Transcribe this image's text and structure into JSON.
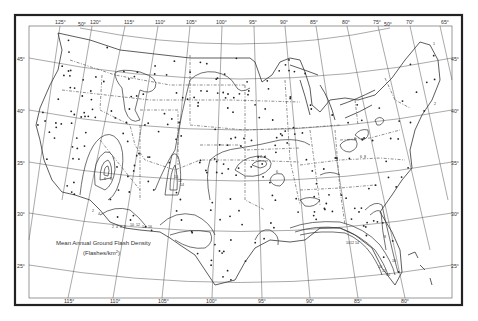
{
  "map": {
    "title_line1": "Mean Annual Ground Flash Density",
    "title_line2": "(Flashes/km",
    "title_units_sup": "2",
    "title_line2_end": ")",
    "top_longitude_labels": [
      "125°",
      "120°",
      "115°",
      "110°",
      "105°",
      "100°",
      "95°",
      "90°",
      "85°",
      "80°",
      "75°",
      "70°",
      "65°"
    ],
    "top_latitude_labels": [
      "50°",
      "50°"
    ],
    "bottom_longitude_labels": [
      "115°",
      "110°",
      "105°",
      "100°",
      "95°",
      "90°",
      "85°",
      "80°"
    ],
    "left_latitude_labels": [
      "45°",
      "40°",
      "35°",
      "30°",
      "25°"
    ],
    "right_latitude_labels": [
      "45°",
      "40°",
      "35°",
      "30°",
      "25°"
    ],
    "contour_labels": [
      "2",
      "4",
      "6",
      "8",
      "10",
      "12",
      "14",
      "16",
      "2",
      "4",
      "6",
      "8",
      "10",
      "12",
      "14",
      "2",
      "4",
      "6",
      "8",
      "6",
      "8",
      "10",
      "12",
      "14",
      "8",
      "10",
      "12",
      "14",
      "16",
      "1",
      "2"
    ]
  }
}
